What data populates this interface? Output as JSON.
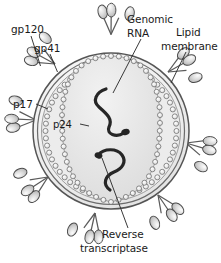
{
  "figure": {
    "background_color": "#ffffff"
  },
  "labels": {
    "gp120": "gp120",
    "gp41": "gp41",
    "p17": "p17",
    "p24": "p24",
    "genomic_rna_line1": "Genomic",
    "genomic_rna_line2": "RNA",
    "lipid_membrane_line1": "Lipid",
    "lipid_membrane_line2": "membrane",
    "reverse_transcriptase_line1": "Reverse",
    "reverse_transcriptase_line2": "transcriptase"
  },
  "colors": {
    "outline": "#4a4a4a",
    "label_text": "#1a1a1a",
    "leader_line": "#3a3a3a",
    "envelope_fill": "#f0f0f0",
    "matrix_fill": "#e4e4e4",
    "core_fill": "#e8e8e8",
    "capsid_bead": "#f4f4f4",
    "capsid_bead_stroke": "#6a6a6a",
    "rna_strand": "#2a2a2a",
    "spike_head_fill": "#d8d8d8",
    "spike_head_stroke": "#4a4a4a",
    "spike_stalk": "#5a5a5a"
  },
  "structures": {
    "envelope": "lipid bilayer double-line circle",
    "matrix": "p17 matrix layer",
    "capsid": "p24 conical/oval capsid of beads",
    "genome": "two S-shaped RNA strands",
    "enzymes": "two reverse transcriptase blobs on RNA",
    "spikes_count": 8,
    "spike_composition": "three gp120 heads on gp41 stalks"
  },
  "spikes": [
    {
      "name": "spike-top",
      "angle_deg": -90
    },
    {
      "name": "spike-upper-left",
      "angle_deg": -150
    },
    {
      "name": "spike-upper-right",
      "angle_deg": -32
    },
    {
      "name": "spike-right",
      "angle_deg": 18
    },
    {
      "name": "spike-lower-right",
      "angle_deg": 58
    },
    {
      "name": "spike-bottom",
      "angle_deg": 96
    },
    {
      "name": "spike-lower-left",
      "angle_deg": 140
    },
    {
      "name": "spike-left",
      "angle_deg": 172
    }
  ]
}
